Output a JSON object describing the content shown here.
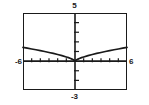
{
  "window": {
    "title": "Graphing calculator plot window"
  },
  "labels": {
    "ymax": "5",
    "ymin": "-3",
    "xmin": "-6",
    "xmax": "6"
  },
  "chart_data": {
    "type": "line",
    "title": "",
    "xlabel": "",
    "ylabel": "",
    "xlim": [
      -6,
      6
    ],
    "ylim": [
      -3,
      5
    ],
    "xtick_step": 1,
    "ytick_step": 1,
    "grid": false,
    "legend": false,
    "axis_color": "#1a1a1a",
    "curve_color": "#1a1a1a",
    "frame_color": "#1a1a1a",
    "background": "#ffffff",
    "tick_labels_shown": {
      "x": [
        "-6",
        "6"
      ],
      "y": [
        "-3",
        "5"
      ]
    },
    "series": [
      {
        "name": "y = x^(2/3)",
        "x": [
          -6.0,
          -5.5,
          -5.0,
          -4.5,
          -4.0,
          -3.5,
          -3.0,
          -2.5,
          -2.0,
          -1.5,
          -1.0,
          -0.75,
          -0.5,
          -0.35,
          -0.2,
          -0.1,
          -0.05,
          0.0,
          0.05,
          0.1,
          0.2,
          0.35,
          0.5,
          0.75,
          1.0,
          1.5,
          2.0,
          2.5,
          3.0,
          3.5,
          4.0,
          4.5,
          5.0,
          5.5,
          6.0
        ],
        "y": [
          1.43,
          1.35,
          1.26,
          1.18,
          1.09,
          1.0,
          0.9,
          0.8,
          0.69,
          0.57,
          0.43,
          0.36,
          0.27,
          0.21,
          0.14,
          0.09,
          0.06,
          0.0,
          0.06,
          0.09,
          0.14,
          0.21,
          0.27,
          0.36,
          0.43,
          0.57,
          0.69,
          0.8,
          0.9,
          1.0,
          1.09,
          1.18,
          1.26,
          1.35,
          1.43
        ]
      }
    ]
  }
}
